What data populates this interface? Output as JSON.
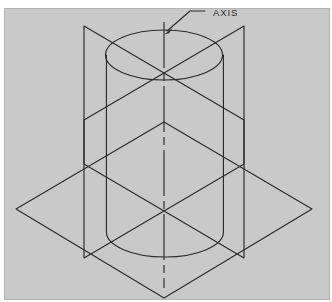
{
  "figure": {
    "type": "technical-line-drawing",
    "canvas": {
      "width": 332,
      "height": 302
    },
    "background_color": "#c9c9c9",
    "paper_color": "#ffffff",
    "line_color": "#2b2b2b",
    "line_width": 1.15,
    "annotations": [
      {
        "name": "axis-label",
        "text": "AXIS",
        "text_x": 213,
        "text_y": 14,
        "leader": {
          "x1": 205,
          "y1": 11,
          "x2": 190,
          "y2": 11,
          "x3": 167,
          "y3": 31
        },
        "arrow_target": {
          "x": 165,
          "y": 33
        }
      }
    ],
    "geometry": {
      "center_x": 164,
      "cylinder": {
        "name": "cylinder",
        "left_x": 107,
        "right_x": 224,
        "radius_x": 58.5,
        "radius_y": 25,
        "top_center_y": 55,
        "bottom_center_y": 232,
        "height": 177
      },
      "horizontal_plane": {
        "name": "horizontal-cutting-plane",
        "left": {
          "x": 16,
          "y": 209
        },
        "top": {
          "x": 164,
          "y": 122
        },
        "right": {
          "x": 312,
          "y": 209
        },
        "bottom": {
          "x": 164,
          "y": 298
        }
      },
      "left_vertical_plane": {
        "name": "left-vertical-cutting-plane",
        "top_left": {
          "x": 84,
          "y": 26
        },
        "top_right": {
          "x": 244,
          "y": 120
        },
        "bottom_right": {
          "x": 244,
          "y": 258
        },
        "bottom_left": {
          "x": 84,
          "y": 258
        }
      },
      "right_vertical_plane": {
        "name": "right-vertical-cutting-plane",
        "top_right": {
          "x": 244,
          "y": 26
        },
        "top_left": {
          "x": 84,
          "y": 120
        },
        "bottom_left": {
          "x": 84,
          "y": 258
        },
        "bottom_right": {
          "x": 244,
          "y": 258
        }
      },
      "axis_line": {
        "name": "center-axis-line",
        "x": 164,
        "y_top": 22,
        "y_bottom": 288,
        "style": "center-line"
      },
      "plane_cross_points": [
        {
          "name": "upper-plane-crossing",
          "x": 164,
          "y": 73
        },
        {
          "name": "lower-plane-crossing",
          "x": 164,
          "y": 210
        }
      ]
    }
  }
}
